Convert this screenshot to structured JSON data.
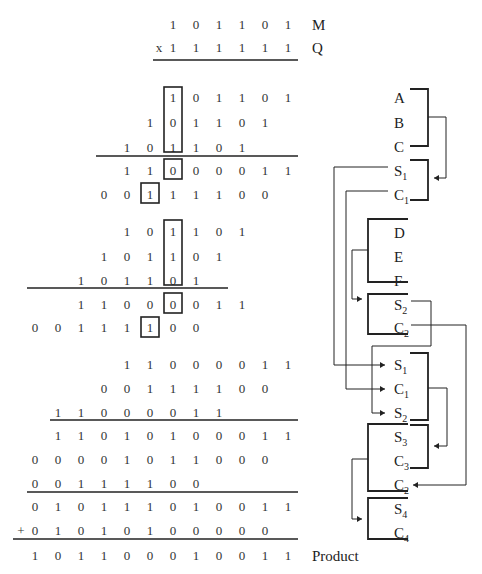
{
  "multiplication": {
    "column_x": [
      35,
      58,
      81,
      104,
      127,
      150,
      173,
      196,
      219,
      242,
      265,
      288
    ],
    "operands": [
      {
        "name": "operand-m",
        "y": 25,
        "prefix": "",
        "bits": {
          "6": "1",
          "7": "0",
          "8": "1",
          "9": "1",
          "10": "0",
          "11": "1"
        },
        "label": "M"
      },
      {
        "name": "operand-q",
        "y": 48,
        "prefix": "x",
        "bits": {
          "6": "1",
          "7": "1",
          "8": "1",
          "9": "1",
          "10": "1",
          "11": "1"
        },
        "label": "Q"
      }
    ],
    "rows": [
      {
        "group": "A",
        "y": 98,
        "bits": {
          "6": "1",
          "7": "0",
          "8": "1",
          "9": "1",
          "10": "0",
          "11": "1"
        }
      },
      {
        "group": "B",
        "y": 123,
        "bits": {
          "5": "1",
          "6": "0",
          "7": "1",
          "8": "1",
          "9": "0",
          "10": "1"
        }
      },
      {
        "group": "C",
        "y": 148,
        "bits": {
          "4": "1",
          "5": "0",
          "6": "1",
          "7": "1",
          "8": "0",
          "9": "1"
        }
      },
      {
        "group": "S1",
        "y": 171,
        "bits": {
          "4": "1",
          "5": "1",
          "6": "0",
          "7": "0",
          "8": "0",
          "9": "0",
          "10": "1",
          "11": "1"
        }
      },
      {
        "group": "C1",
        "y": 195,
        "bits": {
          "3": "0",
          "4": "0",
          "5": "1",
          "6": "1",
          "7": "1",
          "8": "1",
          "9": "0",
          "10": "0"
        }
      },
      {
        "group": "D",
        "y": 232,
        "bits": {
          "4": "1",
          "5": "0",
          "6": "1",
          "7": "1",
          "8": "0",
          "9": "1"
        }
      },
      {
        "group": "E",
        "y": 257,
        "bits": {
          "3": "1",
          "4": "0",
          "5": "1",
          "6": "1",
          "7": "0",
          "8": "1"
        }
      },
      {
        "group": "F",
        "y": 281,
        "bits": {
          "2": "1",
          "3": "0",
          "4": "1",
          "5": "1",
          "6": "0",
          "7": "1"
        }
      },
      {
        "group": "S2",
        "y": 305,
        "bits": {
          "2": "1",
          "3": "1",
          "4": "0",
          "5": "0",
          "6": "0",
          "7": "0",
          "8": "1",
          "9": "1"
        }
      },
      {
        "group": "C2",
        "y": 328,
        "bits": {
          "0": "0",
          "1": "0",
          "2": "1",
          "3": "1",
          "4": "1",
          "5": "1",
          "6": "0",
          "7": "0"
        }
      },
      {
        "group": "S1b",
        "y": 365,
        "bits": {
          "4": "1",
          "5": "1",
          "6": "0",
          "7": "0",
          "8": "0",
          "9": "0",
          "10": "1",
          "11": "1"
        }
      },
      {
        "group": "C1b",
        "y": 389,
        "bits": {
          "3": "0",
          "4": "0",
          "5": "1",
          "6": "1",
          "7": "1",
          "8": "1",
          "9": "0",
          "10": "0"
        }
      },
      {
        "group": "S2b",
        "y": 413,
        "bits": {
          "1": "1",
          "2": "1",
          "3": "0",
          "4": "0",
          "5": "0",
          "6": "0",
          "7": "1",
          "8": "1"
        }
      },
      {
        "group": "S3",
        "y": 436,
        "bits": {
          "1": "1",
          "2": "1",
          "3": "0",
          "4": "1",
          "5": "0",
          "6": "1",
          "7": "0",
          "8": "0",
          "9": "0",
          "10": "1",
          "11": "1"
        }
      },
      {
        "group": "C3",
        "y": 460,
        "bits": {
          "0": "0",
          "1": "0",
          "2": "0",
          "3": "0",
          "4": "1",
          "5": "0",
          "6": "1",
          "7": "1",
          "8": "0",
          "9": "0",
          "10": "0"
        }
      },
      {
        "group": "C2b",
        "y": 484,
        "bits": {
          "0": "0",
          "1": "0",
          "2": "1",
          "3": "1",
          "4": "1",
          "5": "1",
          "6": "0",
          "7": "0"
        }
      },
      {
        "group": "S4",
        "y": 507,
        "bits": {
          "0": "0",
          "1": "1",
          "2": "0",
          "3": "1",
          "4": "1",
          "5": "1",
          "6": "0",
          "7": "1",
          "8": "0",
          "9": "0",
          "10": "1",
          "11": "1"
        }
      },
      {
        "group": "C4",
        "y": 531,
        "prefix": "+",
        "bits": {
          "0": "0",
          "1": "1",
          "2": "0",
          "3": "1",
          "4": "0",
          "5": "1",
          "6": "0",
          "7": "0",
          "8": "0",
          "9": "0",
          "10": "0"
        }
      },
      {
        "group": "Product",
        "y": 556,
        "bits": {
          "0": "1",
          "1": "0",
          "2": "1",
          "3": "1",
          "4": "0",
          "5": "0",
          "6": "0",
          "7": "1",
          "8": "0",
          "9": "0",
          "10": "1",
          "11": "1"
        },
        "label": "Product"
      }
    ],
    "rules": [
      {
        "x1": 153,
        "x2": 298,
        "y": 60
      },
      {
        "x1": 96,
        "x2": 298,
        "y": 156
      },
      {
        "x1": 27,
        "x2": 228,
        "y": 288
      },
      {
        "x1": 50,
        "x2": 298,
        "y": 420
      },
      {
        "x1": 27,
        "x2": 298,
        "y": 492
      },
      {
        "x1": 13,
        "x2": 298,
        "y": 539
      }
    ],
    "boxes": [
      {
        "x": 164,
        "y": 87,
        "w": 18,
        "h": 65
      },
      {
        "x": 164,
        "y": 159,
        "w": 18,
        "h": 20
      },
      {
        "x": 141,
        "y": 183,
        "w": 18,
        "h": 20
      },
      {
        "x": 164,
        "y": 220,
        "w": 18,
        "h": 65
      },
      {
        "x": 164,
        "y": 293,
        "w": 18,
        "h": 20
      },
      {
        "x": 141,
        "y": 317,
        "w": 18,
        "h": 20
      }
    ]
  },
  "diagram": {
    "labels": [
      {
        "name": "A",
        "main": "A",
        "sub": "",
        "x": 394,
        "y": 98
      },
      {
        "name": "B",
        "main": "B",
        "sub": "",
        "x": 394,
        "y": 123
      },
      {
        "name": "C",
        "main": "C",
        "sub": "",
        "x": 394,
        "y": 147
      },
      {
        "name": "S1",
        "main": "S",
        "sub": "1",
        "x": 394,
        "y": 171
      },
      {
        "name": "C1",
        "main": "C",
        "sub": "1",
        "x": 394,
        "y": 195
      },
      {
        "name": "D",
        "main": "D",
        "sub": "",
        "x": 394,
        "y": 233
      },
      {
        "name": "E",
        "main": "E",
        "sub": "",
        "x": 394,
        "y": 257
      },
      {
        "name": "F",
        "main": "F",
        "sub": "",
        "x": 394,
        "y": 281
      },
      {
        "name": "S2",
        "main": "S",
        "sub": "2",
        "x": 394,
        "y": 305
      },
      {
        "name": "C2",
        "main": "C",
        "sub": "2",
        "x": 394,
        "y": 328
      },
      {
        "name": "S1-stage2",
        "main": "S",
        "sub": "1",
        "x": 394,
        "y": 365
      },
      {
        "name": "C1-stage2",
        "main": "C",
        "sub": "1",
        "x": 394,
        "y": 389
      },
      {
        "name": "S2-stage2",
        "main": "S",
        "sub": "2",
        "x": 394,
        "y": 413
      },
      {
        "name": "S3",
        "main": "S",
        "sub": "3",
        "x": 394,
        "y": 437
      },
      {
        "name": "C3",
        "main": "C",
        "sub": "3",
        "x": 394,
        "y": 461
      },
      {
        "name": "C2-stage3",
        "main": "C",
        "sub": "2",
        "x": 394,
        "y": 485
      },
      {
        "name": "S4",
        "main": "S",
        "sub": "4",
        "x": 394,
        "y": 509
      },
      {
        "name": "C4",
        "main": "C",
        "sub": "4",
        "x": 394,
        "y": 533
      }
    ],
    "brackets": [
      "M410,89 H428 V146 H410",
      "M410,160 H428 V200 H410",
      "M408,219 H368 V282 H408",
      "M408,294 H368 V334 H408",
      "M410,353 H428 V420 H410",
      "M410,425 H428 V468 H410",
      "M408,424 H368 V491 H408",
      "M408,498 H368 V539 H408"
    ],
    "wires": [
      "M428,117 H446 V178 H434",
      "M388,167 H334 V365 H385",
      "M388,191 H346 V389 H385",
      "M368,250 H352 V299 H362",
      "M411,301 H431 V346 H372 V413 H385",
      "M411,325 H466 V485 H413",
      "M428,388 H447 V446 H434",
      "M368,459 H352 V519 H362"
    ],
    "arrowheads": [
      {
        "name": "arrow-to-s1c1-adder",
        "x": 434,
        "y": 178,
        "dir": "left"
      },
      {
        "name": "arrow-to-s2c2-adder",
        "x": 362,
        "y": 299,
        "dir": "right"
      },
      {
        "name": "arrow-to-s1",
        "x": 385,
        "y": 365,
        "dir": "right"
      },
      {
        "name": "arrow-to-c1",
        "x": 385,
        "y": 389,
        "dir": "right"
      },
      {
        "name": "arrow-to-s2",
        "x": 385,
        "y": 413,
        "dir": "right"
      },
      {
        "name": "arrow-to-s3c3-adder",
        "x": 434,
        "y": 446,
        "dir": "left"
      },
      {
        "name": "arrow-to-c2",
        "x": 413,
        "y": 485,
        "dir": "left"
      },
      {
        "name": "arrow-to-s4c4-adder",
        "x": 362,
        "y": 519,
        "dir": "right"
      }
    ]
  }
}
